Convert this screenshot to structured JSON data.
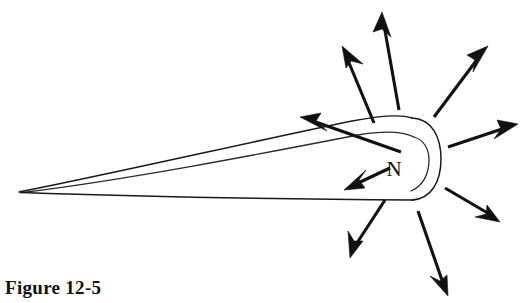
{
  "figure": {
    "caption": "Figure 12-5",
    "pole_label": "N",
    "background_color": "#ffffff",
    "ink_color": "#111111"
  },
  "diagram": {
    "type": "line-drawing",
    "magnet": {
      "shape": "long-tapered-wedge-with-rounded-blunt-end",
      "tip_point": [
        21,
        191
      ],
      "blunt_end_center": [
        410,
        160
      ],
      "outer_arc_right_x": 441,
      "inner_arc_right_x": 428,
      "top_ridge_y_at_end": 118,
      "bottom_edge_y": 200
    },
    "arrow_count": 8,
    "outward_arrow_count": 7,
    "inward_arrow_count": 1,
    "arrows": [
      {
        "name": "arrow-up-left-crossing",
        "tail": [
          401,
          152
        ],
        "tip": [
          300,
          117
        ],
        "direction": "up-left",
        "sense": "outward"
      },
      {
        "name": "arrow-upper-left-diagonal",
        "tail": [
          374,
          123
        ],
        "tip": [
          342,
          46
        ],
        "direction": "up-left",
        "sense": "outward"
      },
      {
        "name": "arrow-top-vertical",
        "tail": [
          399,
          110
        ],
        "tip": [
          382,
          12
        ],
        "direction": "up",
        "sense": "outward"
      },
      {
        "name": "arrow-upper-right-diagonal",
        "tail": [
          434,
          117
        ],
        "tip": [
          488,
          46
        ],
        "direction": "up-right",
        "sense": "outward"
      },
      {
        "name": "arrow-right-horizontal",
        "tail": [
          448,
          147
        ],
        "tip": [
          518,
          124
        ],
        "direction": "right",
        "sense": "outward"
      },
      {
        "name": "arrow-lower-right-diagonal",
        "tail": [
          445,
          188
        ],
        "tip": [
          500,
          222
        ],
        "direction": "down-right",
        "sense": "outward"
      },
      {
        "name": "arrow-bottom-vertical",
        "tail": [
          418,
          211
        ],
        "tip": [
          448,
          296
        ],
        "direction": "down",
        "sense": "outward"
      },
      {
        "name": "arrow-lower-left-diagonal",
        "tail": [
          385,
          200
        ],
        "tip": [
          350,
          258
        ],
        "direction": "down-left",
        "sense": "outward"
      },
      {
        "name": "arrow-inward-left",
        "tail": [
          390,
          168
        ],
        "tip": [
          344,
          190
        ],
        "direction": "down-left",
        "sense": "inward"
      }
    ]
  }
}
